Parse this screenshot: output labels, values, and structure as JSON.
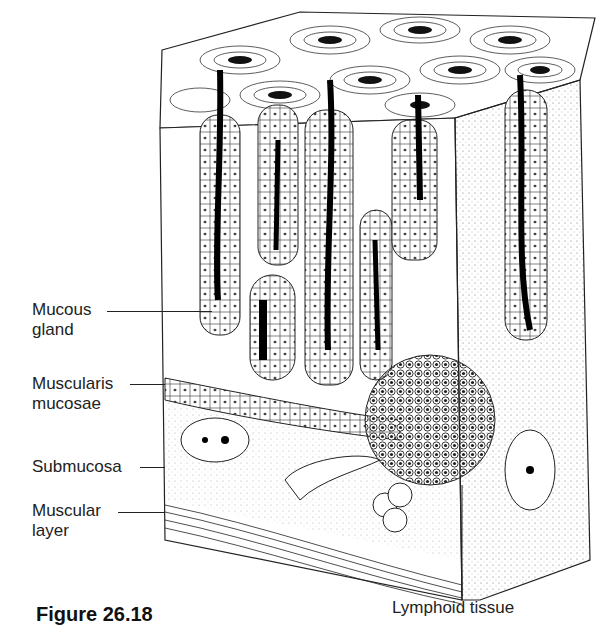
{
  "figure": {
    "caption": "Figure 26.18"
  },
  "labels": [
    {
      "id": "mucous-gland",
      "line1": "Mucous",
      "line2": "gland"
    },
    {
      "id": "muscularis-mucosae",
      "line1": "Muscularis",
      "line2": "mucosae"
    },
    {
      "id": "submucosa",
      "line1": "Submucosa",
      "line2": ""
    },
    {
      "id": "muscular-layer",
      "line1": "Muscular",
      "line2": "layer"
    },
    {
      "id": "lymphoid-tissue",
      "line1": "Lymphoid tissue",
      "line2": ""
    }
  ]
}
